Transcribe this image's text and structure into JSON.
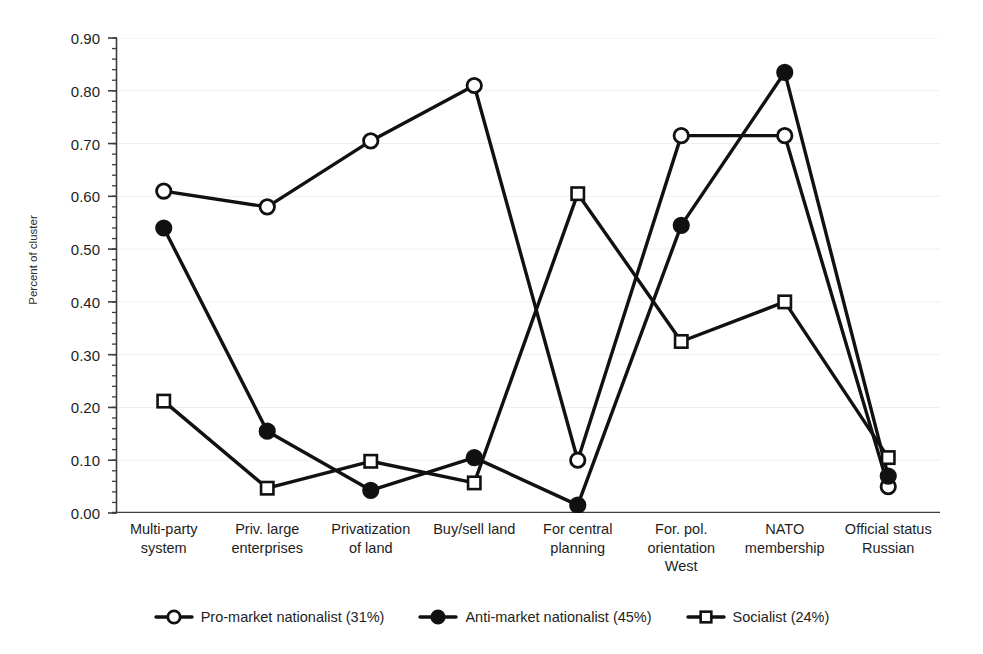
{
  "chart_data": {
    "type": "line",
    "title": "",
    "xlabel": "",
    "ylabel": "Percent of cluster",
    "ylim": [
      0.0,
      0.9
    ],
    "ytick_step": 0.1,
    "minor_ticks": true,
    "grid": true,
    "grid_color": "#efefef",
    "legend_position": "bottom",
    "line_color": "#111111",
    "categories": [
      "Multi-party\nsystem",
      "Priv. large\nenterprises",
      "Privatization\nof land",
      "Buy/sell land",
      "For central\nplanning",
      "For. pol.\norientation\nWest",
      "NATO\nmembership",
      "Official status\nRussian"
    ],
    "ytick_labels": [
      "0.90",
      "0.80",
      "0.70",
      "0.60",
      "0.50",
      "0.40",
      "0.30",
      "0.20",
      "0.10",
      "0.00"
    ],
    "ytick_values": [
      0.9,
      0.8,
      0.7,
      0.6,
      0.5,
      0.4,
      0.3,
      0.2,
      0.1,
      0.0
    ],
    "series": [
      {
        "name": "Pro-market nationalist (31%)",
        "marker": "open-circle",
        "values": [
          0.61,
          0.58,
          0.705,
          0.81,
          0.1,
          0.715,
          0.715,
          0.05
        ]
      },
      {
        "name": "Anti-market nationalist (45%)",
        "marker": "filled-circle",
        "values": [
          0.54,
          0.155,
          0.043,
          0.105,
          0.015,
          0.545,
          0.835,
          0.07
        ]
      },
      {
        "name": "Socialist (24%)",
        "marker": "open-square",
        "values": [
          0.212,
          0.047,
          0.098,
          0.057,
          0.605,
          0.325,
          0.4,
          0.105
        ]
      }
    ]
  },
  "legend": {
    "items": [
      {
        "label": "Pro-market nationalist (31%)",
        "marker": "open-circle"
      },
      {
        "label": "Anti-market nationalist (45%)",
        "marker": "filled-circle"
      },
      {
        "label": "Socialist (24%)",
        "marker": "open-square"
      }
    ]
  }
}
